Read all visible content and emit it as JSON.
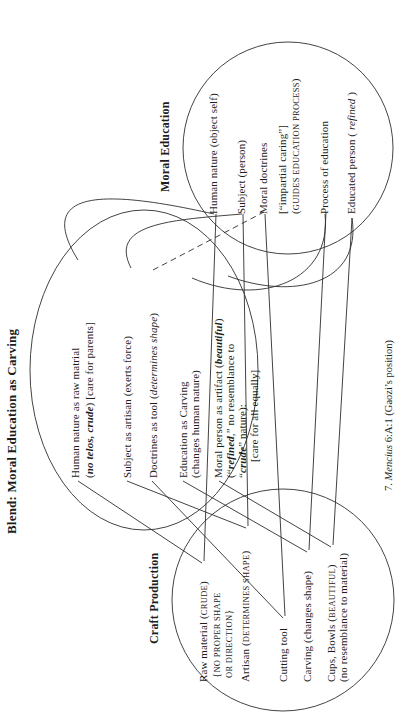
{
  "figure": {
    "paper_color": "#ffffff",
    "ink_color": "#1d1d1d",
    "line_color": "#2e2e2e",
    "caption": {
      "segments": [
        {
          "t": "7.  "
        },
        {
          "t": "Mencius",
          "s": "i"
        },
        {
          "t": " 6:A:1  (Gaozi’s position)"
        }
      ]
    },
    "blend": {
      "title": "Blend: Moral Education as Carving",
      "items": [
        {
          "segments": [
            {
              "t": "Human nature as raw matrial"
            }
          ]
        },
        {
          "segments": [
            {
              "t": "("
            },
            {
              "t": "no telos, crude",
              "s": "bi"
            },
            {
              "t": ") [care for parents]"
            }
          ]
        },
        {
          "segments": [
            {
              "t": "Subject as artisan (exerts force)"
            }
          ]
        },
        {
          "segments": [
            {
              "t": "Doctrines as tool ("
            },
            {
              "t": "determines shape",
              "s": "i"
            },
            {
              "t": ")"
            }
          ]
        },
        {
          "segments": [
            {
              "t": "Education as Carving"
            }
          ]
        },
        {
          "segments": [
            {
              "t": "(changes human nature)"
            }
          ]
        },
        {
          "segments": [
            {
              "t": "Moral person as artifact ("
            },
            {
              "t": "beautiful",
              "s": "bi"
            },
            {
              "t": ")"
            }
          ]
        },
        {
          "segments": [
            {
              "t": "(“"
            },
            {
              "t": "refined",
              "s": "bi"
            },
            {
              "t": ",” no resemblance to"
            }
          ]
        },
        {
          "segments": [
            {
              "t": "“"
            },
            {
              "t": "crude",
              "s": "bi"
            },
            {
              "t": "” nature):"
            }
          ]
        },
        {
          "segments": [
            {
              "t": "[care for all equally]"
            }
          ]
        }
      ]
    },
    "craft": {
      "title": "Craft Production",
      "items": [
        {
          "segments": [
            {
              "t": "Raw material ("
            },
            {
              "t": "CRUDE",
              "s": "sc"
            },
            {
              "t": ")"
            }
          ]
        },
        {
          "segments": [
            {
              "t": "{"
            },
            {
              "t": "NO PROPER SHAPE",
              "s": "sc"
            }
          ]
        },
        {
          "segments": [
            {
              "t": "OR DIRECTION",
              "s": "sc"
            },
            {
              "t": "}"
            }
          ]
        },
        {
          "segments": [
            {
              "t": "Artisan ("
            },
            {
              "t": "DETERMINES SHAPE",
              "s": "sc"
            },
            {
              "t": ")"
            }
          ]
        },
        {
          "segments": [
            {
              "t": "Cutting tool"
            }
          ]
        },
        {
          "segments": [
            {
              "t": "Carving (changes shape)"
            }
          ]
        },
        {
          "segments": [
            {
              "t": "Cups, Bowls ("
            },
            {
              "t": "BEAUTIFUL",
              "s": "sc"
            },
            {
              "t": ")"
            }
          ]
        },
        {
          "segments": [
            {
              "t": "(no resemblance to material)"
            }
          ]
        }
      ]
    },
    "moral": {
      "title": "Moral Education",
      "items": [
        {
          "segments": [
            {
              "t": "Human nature (object self)"
            }
          ]
        },
        {
          "segments": [
            {
              "t": "Subject (person)"
            }
          ]
        },
        {
          "segments": [
            {
              "t": "Moral doctrines"
            }
          ]
        },
        {
          "segments": [
            {
              "t": "[“impartial caring”]"
            }
          ]
        },
        {
          "segments": [
            {
              "t": "("
            },
            {
              "t": "GUIDES EDUCATION PROCESS",
              "s": "sc"
            },
            {
              "t": ")"
            }
          ]
        },
        {
          "segments": [
            {
              "t": "Process of education"
            }
          ]
        },
        {
          "segments": [
            {
              "t": "Educated person ( "
            },
            {
              "t": "refined",
              "s": "i"
            },
            {
              "t": " )"
            }
          ]
        }
      ]
    }
  }
}
